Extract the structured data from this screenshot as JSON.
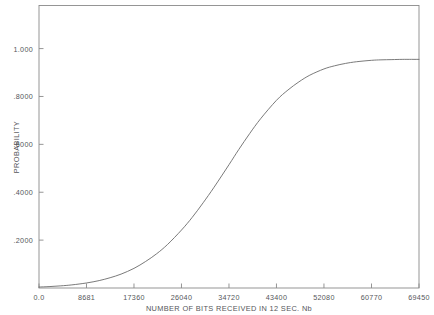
{
  "chart_data": {
    "type": "line",
    "title": "",
    "xlabel": "NUMBER OF BITS RECEIVED IN 12 SEC. Nb",
    "ylabel": "PROBABILITY",
    "xlim": [
      0,
      69450
    ],
    "ylim": [
      0,
      1.18
    ],
    "grid": false,
    "legend": "none",
    "x_tick_labels": [
      "0.0",
      "8681",
      "17360",
      "26040",
      "34720",
      "43400",
      "52080",
      "60770",
      "69450"
    ],
    "x_tick_values": [
      0,
      8681,
      17360,
      26040,
      34720,
      43400,
      52080,
      60770,
      69450
    ],
    "y_tick_labels": [
      ".2000",
      ".4000",
      ".6000",
      ".8000",
      "1.000"
    ],
    "y_tick_values": [
      0.2,
      0.4,
      0.6,
      0.8,
      1.0
    ],
    "series": [
      {
        "name": "cumulative probability",
        "x": [
          0,
          2000,
          4000,
          6000,
          8681,
          11000,
          13000,
          15000,
          17360,
          19500,
          21500,
          23500,
          26040,
          28000,
          30000,
          32000,
          34720,
          36500,
          38500,
          40500,
          43400,
          45500,
          47500,
          49500,
          52080,
          54000,
          56000,
          58000,
          60770,
          62500,
          64500,
          66500,
          69450
        ],
        "y": [
          0.004,
          0.006,
          0.009,
          0.013,
          0.021,
          0.031,
          0.043,
          0.058,
          0.082,
          0.111,
          0.143,
          0.182,
          0.242,
          0.295,
          0.356,
          0.421,
          0.515,
          0.578,
          0.645,
          0.707,
          0.784,
          0.827,
          0.861,
          0.889,
          0.915,
          0.928,
          0.938,
          0.945,
          0.951,
          0.953,
          0.954,
          0.955,
          0.955
        ]
      }
    ]
  },
  "axes": {
    "x_title": "NUMBER OF BITS RECEIVED IN 12 SEC. Nb",
    "y_title": "PROBABILITY"
  },
  "style": {
    "curve_color": "#6b6b6b",
    "frame_color": "#8a8a8a",
    "text_color": "#55565a",
    "background": "#ffffff"
  }
}
